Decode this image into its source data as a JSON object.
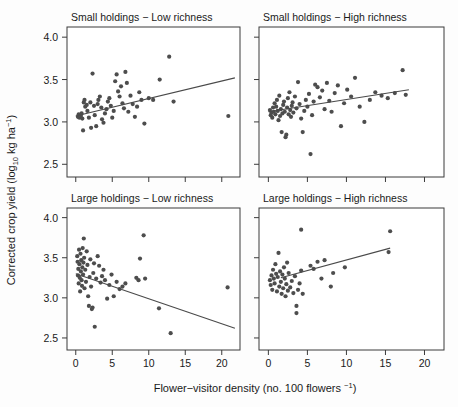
{
  "figure": {
    "axis_titles": {
      "x": "Flower−visitor density (no. 100 flowers ⁻¹)",
      "x_main": "Flower−visitor density (no. 100 flowers ",
      "x_sup": "−1",
      "x_tail": ")",
      "y": "Corrected crop yield (log10 kg ha-1)",
      "y_part1": "Corrected crop yield (log",
      "y_sub": "10",
      "y_part2": " kg ha",
      "y_sup": "−1",
      "y_part3": ")"
    },
    "point_color": "#4d4d4d",
    "line_color": "#4a4a4a",
    "frame_color": "#3b3b3b",
    "background": "#fdfdfd"
  },
  "chart_data": [
    {
      "type": "scatter",
      "panel_id": "small-low",
      "title": "Small holdings − Low richness",
      "xlabel": "Flower−visitor density (no. 100 flowers −1)",
      "ylabel": "Corrected crop yield (log10 kg ha−1)",
      "xlim": [
        -1.2,
        22.5
      ],
      "ylim": [
        2.35,
        4.12
      ],
      "xticks": [
        0,
        5,
        10,
        15,
        20
      ],
      "yticks": [
        2.5,
        3.0,
        3.5,
        4.0
      ],
      "grid": false,
      "legend": "none",
      "fit_line": {
        "x0": 0.0,
        "y0": 3.07,
        "x1": 21.8,
        "y1": 3.52
      },
      "x": [
        0.3,
        0.4,
        0.5,
        0.6,
        0.7,
        0.8,
        0.9,
        1.0,
        1.1,
        1.2,
        1.3,
        1.5,
        1.6,
        1.8,
        2.0,
        2.1,
        2.3,
        2.5,
        2.6,
        2.8,
        3.0,
        3.1,
        3.3,
        3.5,
        3.6,
        3.8,
        4.0,
        4.2,
        4.4,
        4.6,
        4.8,
        5.0,
        5.2,
        5.4,
        5.6,
        5.8,
        6.0,
        6.2,
        6.4,
        6.6,
        6.8,
        7.0,
        7.2,
        7.5,
        7.8,
        8.1,
        8.4,
        8.7,
        9.0,
        9.4,
        10.0,
        10.6,
        11.5,
        12.8,
        13.4,
        20.9
      ],
      "y": [
        3.06,
        3.09,
        3.05,
        3.08,
        3.07,
        3.1,
        3.04,
        2.9,
        3.23,
        3.26,
        3.18,
        3.2,
        3.13,
        3.05,
        3.23,
        2.93,
        3.57,
        3.19,
        3.08,
        2.95,
        3.21,
        3.26,
        3.3,
        3.17,
        3.03,
        2.99,
        3.1,
        3.15,
        3.24,
        3.28,
        3.19,
        3.05,
        3.13,
        3.48,
        3.56,
        3.36,
        3.3,
        3.42,
        3.22,
        3.16,
        3.59,
        3.46,
        3.12,
        3.31,
        3.21,
        3.06,
        3.18,
        3.35,
        3.26,
        2.98,
        3.28,
        3.26,
        3.5,
        3.77,
        3.24,
        3.07
      ],
      "outliers_note": "one low point at (5.6, 2.52)"
    },
    {
      "type": "scatter",
      "panel_id": "small-high",
      "title": "Small holdings − High richness",
      "xlim": [
        -1.2,
        22.5
      ],
      "ylim": [
        2.35,
        4.12
      ],
      "xticks": [
        0,
        5,
        10,
        15,
        20
      ],
      "yticks": [
        2.5,
        3.0,
        3.5,
        4.0
      ],
      "grid": false,
      "legend": "none",
      "fit_line": {
        "x0": 0.0,
        "y0": 3.12,
        "x1": 18.0,
        "y1": 3.38
      },
      "x": [
        0.2,
        0.3,
        0.4,
        0.5,
        0.6,
        0.7,
        0.8,
        0.9,
        1.0,
        1.1,
        1.2,
        1.3,
        1.4,
        1.5,
        1.6,
        1.7,
        1.8,
        1.9,
        2.0,
        2.1,
        2.2,
        2.3,
        2.4,
        2.5,
        2.6,
        2.7,
        2.8,
        2.9,
        3.0,
        3.1,
        3.2,
        3.4,
        3.6,
        3.8,
        4.0,
        4.2,
        4.4,
        4.6,
        4.8,
        5.0,
        5.2,
        5.4,
        5.6,
        5.8,
        6.0,
        6.3,
        6.6,
        6.9,
        7.2,
        7.5,
        7.8,
        8.1,
        8.5,
        8.9,
        9.3,
        9.7,
        10.1,
        10.6,
        11.1,
        11.7,
        12.3,
        13.0,
        13.7,
        14.5,
        15.3,
        16.2,
        17.2,
        17.6
      ],
      "y": [
        3.14,
        3.08,
        3.11,
        3.05,
        3.17,
        3.12,
        3.22,
        3.09,
        3.18,
        3.26,
        3.13,
        3.02,
        3.31,
        3.07,
        3.15,
        2.88,
        3.1,
        3.2,
        3.24,
        3.12,
        2.82,
        2.85,
        3.17,
        3.28,
        3.09,
        3.35,
        3.14,
        3.06,
        3.19,
        3.23,
        3.11,
        3.3,
        3.16,
        3.47,
        3.21,
        3.04,
        2.88,
        3.13,
        3.26,
        3.18,
        3.33,
        2.62,
        3.08,
        3.24,
        3.44,
        3.41,
        3.29,
        3.37,
        3.15,
        3.46,
        3.25,
        3.12,
        3.34,
        3.43,
        2.95,
        3.22,
        3.38,
        3.3,
        3.52,
        3.18,
        3.0,
        3.26,
        3.35,
        3.31,
        3.28,
        3.34,
        3.61,
        3.32
      ]
    },
    {
      "type": "scatter",
      "panel_id": "large-low",
      "title": "Large holdings − Low richness",
      "xlim": [
        -1.2,
        22.5
      ],
      "ylim": [
        2.35,
        4.12
      ],
      "xticks": [
        0,
        5,
        10,
        15,
        20
      ],
      "yticks": [
        2.5,
        3.0,
        3.5,
        4.0
      ],
      "grid": false,
      "legend": "none",
      "fit_line": {
        "x0": 0.0,
        "y0": 3.3,
        "x1": 21.8,
        "y1": 2.62
      },
      "x": [
        0.2,
        0.25,
        0.3,
        0.35,
        0.4,
        0.45,
        0.5,
        0.55,
        0.6,
        0.65,
        0.7,
        0.75,
        0.8,
        0.85,
        0.9,
        0.95,
        1.0,
        1.05,
        1.1,
        1.15,
        1.2,
        1.3,
        1.4,
        1.5,
        1.6,
        1.7,
        1.8,
        1.9,
        2.0,
        2.1,
        2.2,
        2.3,
        2.4,
        2.5,
        2.6,
        2.8,
        3.0,
        3.2,
        3.4,
        3.6,
        3.8,
        4.0,
        4.3,
        4.6,
        4.9,
        5.2,
        5.6,
        6.0,
        6.4,
        6.8,
        8.3,
        8.6,
        8.8,
        9.3,
        9.5,
        11.4,
        13.0,
        20.8
      ],
      "y": [
        3.52,
        3.45,
        3.28,
        3.36,
        3.18,
        3.6,
        3.42,
        3.25,
        3.08,
        3.55,
        3.33,
        3.47,
        3.22,
        3.15,
        3.38,
        3.62,
        3.29,
        3.44,
        3.74,
        3.5,
        3.12,
        3.35,
        3.2,
        3.58,
        3.41,
        3.02,
        2.9,
        3.26,
        3.48,
        3.14,
        2.86,
        2.88,
        3.31,
        3.43,
        2.64,
        3.24,
        3.52,
        3.4,
        3.19,
        3.27,
        3.35,
        3.22,
        2.99,
        3.16,
        3.29,
        3.02,
        3.2,
        3.11,
        3.14,
        3.18,
        3.25,
        3.22,
        3.49,
        3.78,
        3.24,
        2.87,
        2.56,
        3.13
      ],
      "outliers_note": "low cluster near (0.6, 2.67) and (2.6, 2.64)"
    },
    {
      "type": "scatter",
      "panel_id": "large-high",
      "title": "Large holdings − High richness",
      "xlim": [
        -1.2,
        22.5
      ],
      "ylim": [
        2.35,
        4.12
      ],
      "xticks": [
        0,
        5,
        10,
        15,
        20
      ],
      "yticks": [
        2.5,
        3.0,
        3.5,
        4.0
      ],
      "grid": false,
      "legend": "none",
      "fit_line": {
        "x0": 1.6,
        "y0": 3.25,
        "x1": 15.6,
        "y1": 3.62
      },
      "x": [
        0.2,
        0.3,
        0.4,
        0.5,
        0.6,
        0.7,
        0.8,
        0.9,
        1.0,
        1.1,
        1.2,
        1.3,
        1.4,
        1.5,
        1.6,
        1.7,
        1.8,
        1.9,
        2.0,
        2.1,
        2.2,
        2.3,
        2.4,
        2.5,
        2.6,
        2.8,
        3.0,
        3.2,
        3.4,
        3.6,
        3.8,
        4.0,
        4.2,
        4.4,
        5.4,
        5.8,
        6.3,
        6.8,
        7.2,
        8.0,
        8.3,
        9.8,
        15.4,
        15.6,
        4.2,
        3.6
      ],
      "y": [
        3.22,
        3.16,
        3.28,
        3.1,
        3.35,
        3.24,
        3.18,
        3.42,
        3.3,
        3.08,
        3.26,
        3.56,
        3.14,
        3.33,
        3.2,
        3.05,
        3.29,
        3.12,
        3.38,
        3.24,
        3.02,
        3.17,
        3.44,
        3.09,
        3.31,
        3.13,
        3.21,
        3.06,
        3.27,
        2.9,
        3.1,
        3.18,
        3.34,
        3.05,
        3.4,
        3.36,
        3.45,
        3.24,
        3.47,
        3.14,
        3.31,
        3.38,
        3.57,
        3.83,
        3.85,
        2.81
      ]
    }
  ],
  "panels": [
    {
      "id": "small-low",
      "title": "Small holdings − Low richness"
    },
    {
      "id": "small-high",
      "title": "Small holdings − High richness"
    },
    {
      "id": "large-low",
      "title": "Large holdings − Low richness"
    },
    {
      "id": "large-high",
      "title": "Large holdings − High richness"
    }
  ]
}
